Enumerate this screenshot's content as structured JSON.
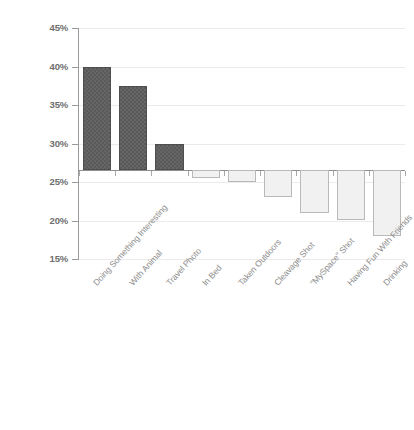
{
  "chart_data": {
    "type": "bar",
    "title": "",
    "subtitle": "",
    "xlabel": "",
    "ylabel": "",
    "ylim": [
      15,
      45
    ],
    "ytick_labels": [
      "45%",
      "40%",
      "35%",
      "30%",
      "25%",
      "20%",
      "15%"
    ],
    "ytick_values": [
      45,
      40,
      35,
      30,
      25,
      20,
      15
    ],
    "grid": true,
    "legend": "none",
    "baseline_value": 26.5,
    "categories": [
      "Doing Something Interesting",
      "With Animal",
      "Travel Photo",
      "In Bed",
      "Taken Outdoors",
      "Cleavage Shot",
      "\"MySpace\" Shot",
      "Having Fun With Friends",
      "Drinking"
    ],
    "values": [
      40,
      37.5,
      30,
      25.5,
      25,
      23,
      21,
      20,
      18
    ],
    "bar_styles": [
      "dark",
      "dark",
      "dark",
      "light",
      "light",
      "light",
      "light",
      "light",
      "light"
    ],
    "colors": {
      "dark_bar": "#5a5a5a",
      "dark_bar_border": "#4e4e4e",
      "light_bar": "#f1f1f1",
      "light_bar_border": "#b9b9b9",
      "gridline": "#eceaea",
      "axis": "#9a9a9a",
      "tick_label": "#6e6e6e",
      "category_label": "#8e8e8e",
      "background": "#ffffff"
    }
  }
}
